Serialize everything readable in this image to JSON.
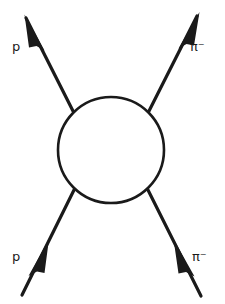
{
  "figure": {
    "kind": "feynman-scattering-diagram",
    "process": "p + pi-minus -> p + pi-minus",
    "background_color": "#ffffff",
    "stroke_color": "#1a1a1a",
    "line_width_px": 3,
    "blob": {
      "name": "interaction-blob",
      "center_x": 111,
      "center_y": 150,
      "radius": 53,
      "fill": "#ffffff",
      "stroke": "#1a1a1a",
      "stroke_width": 2.4
    },
    "legs": [
      {
        "id": "upper-left-leg",
        "label": "p",
        "label_text": "p",
        "direction": "incoming-to-blob-arrow-points-up-left",
        "x1": 74,
        "y1": 113,
        "x2": 22,
        "y2": 13,
        "arrow_x": 39,
        "arrow_y": 46
      },
      {
        "id": "upper-right-leg",
        "label": "pi-minus",
        "label_text": "π⁻",
        "direction": "outgoing-arrow-points-up-right",
        "x1": 148,
        "y1": 113,
        "x2": 201,
        "y2": 11,
        "arrow_x": 184,
        "arrow_y": 44
      },
      {
        "id": "lower-left-leg",
        "label": "p",
        "label_text": "p",
        "direction": "incoming-arrow-points-up-right",
        "x1": 22,
        "y1": 295,
        "x2": 74,
        "y2": 190,
        "arrow_x": 40,
        "arrow_y": 258
      },
      {
        "id": "lower-right-leg",
        "label": "pi-minus",
        "label_text": "π⁻",
        "direction": "incoming-arrow-points-up-left",
        "x1": 201,
        "y1": 296,
        "x2": 148,
        "y2": 190,
        "arrow_x": 183,
        "arrow_y": 258
      }
    ],
    "labels": {
      "upper_left": "p",
      "upper_right": "π⁻",
      "lower_left": "p",
      "lower_right": "π⁻"
    }
  }
}
